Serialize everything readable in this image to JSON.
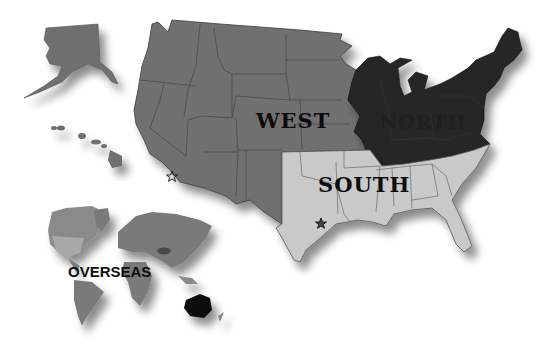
{
  "map": {
    "title": "US regions and overseas map",
    "regions": [
      {
        "id": "west",
        "label": "West",
        "color": "#6f6f6f"
      },
      {
        "id": "north",
        "label": "North",
        "color": "#262626"
      },
      {
        "id": "south",
        "label": "South",
        "color": "#c9c9c9"
      },
      {
        "id": "overseas",
        "label": "OVERSEAS",
        "color": "#7a7a7a"
      }
    ],
    "highlights": {
      "australia_color": "#0a0a0a",
      "north_america_color": "#a8a8a8"
    },
    "markers": [
      {
        "name": "star-marker-west",
        "glyph": "☆",
        "near": "Southern California"
      },
      {
        "name": "star-marker-south",
        "glyph": "☆",
        "near": "Central Texas"
      }
    ],
    "inset_labels": [
      "Alaska",
      "Hawaii"
    ]
  }
}
